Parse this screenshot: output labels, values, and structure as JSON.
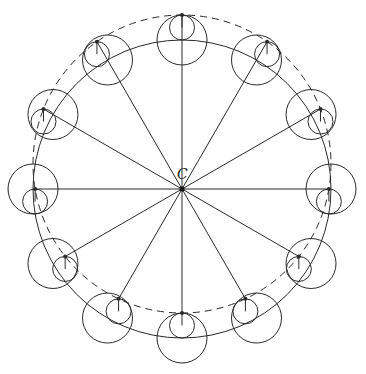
{
  "diagram": {
    "center_label": "C",
    "station_count": 12,
    "stroke_color": "#2a2a2a",
    "background": "#ffffff",
    "elements": [
      "reference circle (solid)",
      "displaced circle (dashed)",
      "radial lines from C",
      "large circle at each station",
      "small hanging circle at each station",
      "pivot point marker at each station"
    ]
  }
}
